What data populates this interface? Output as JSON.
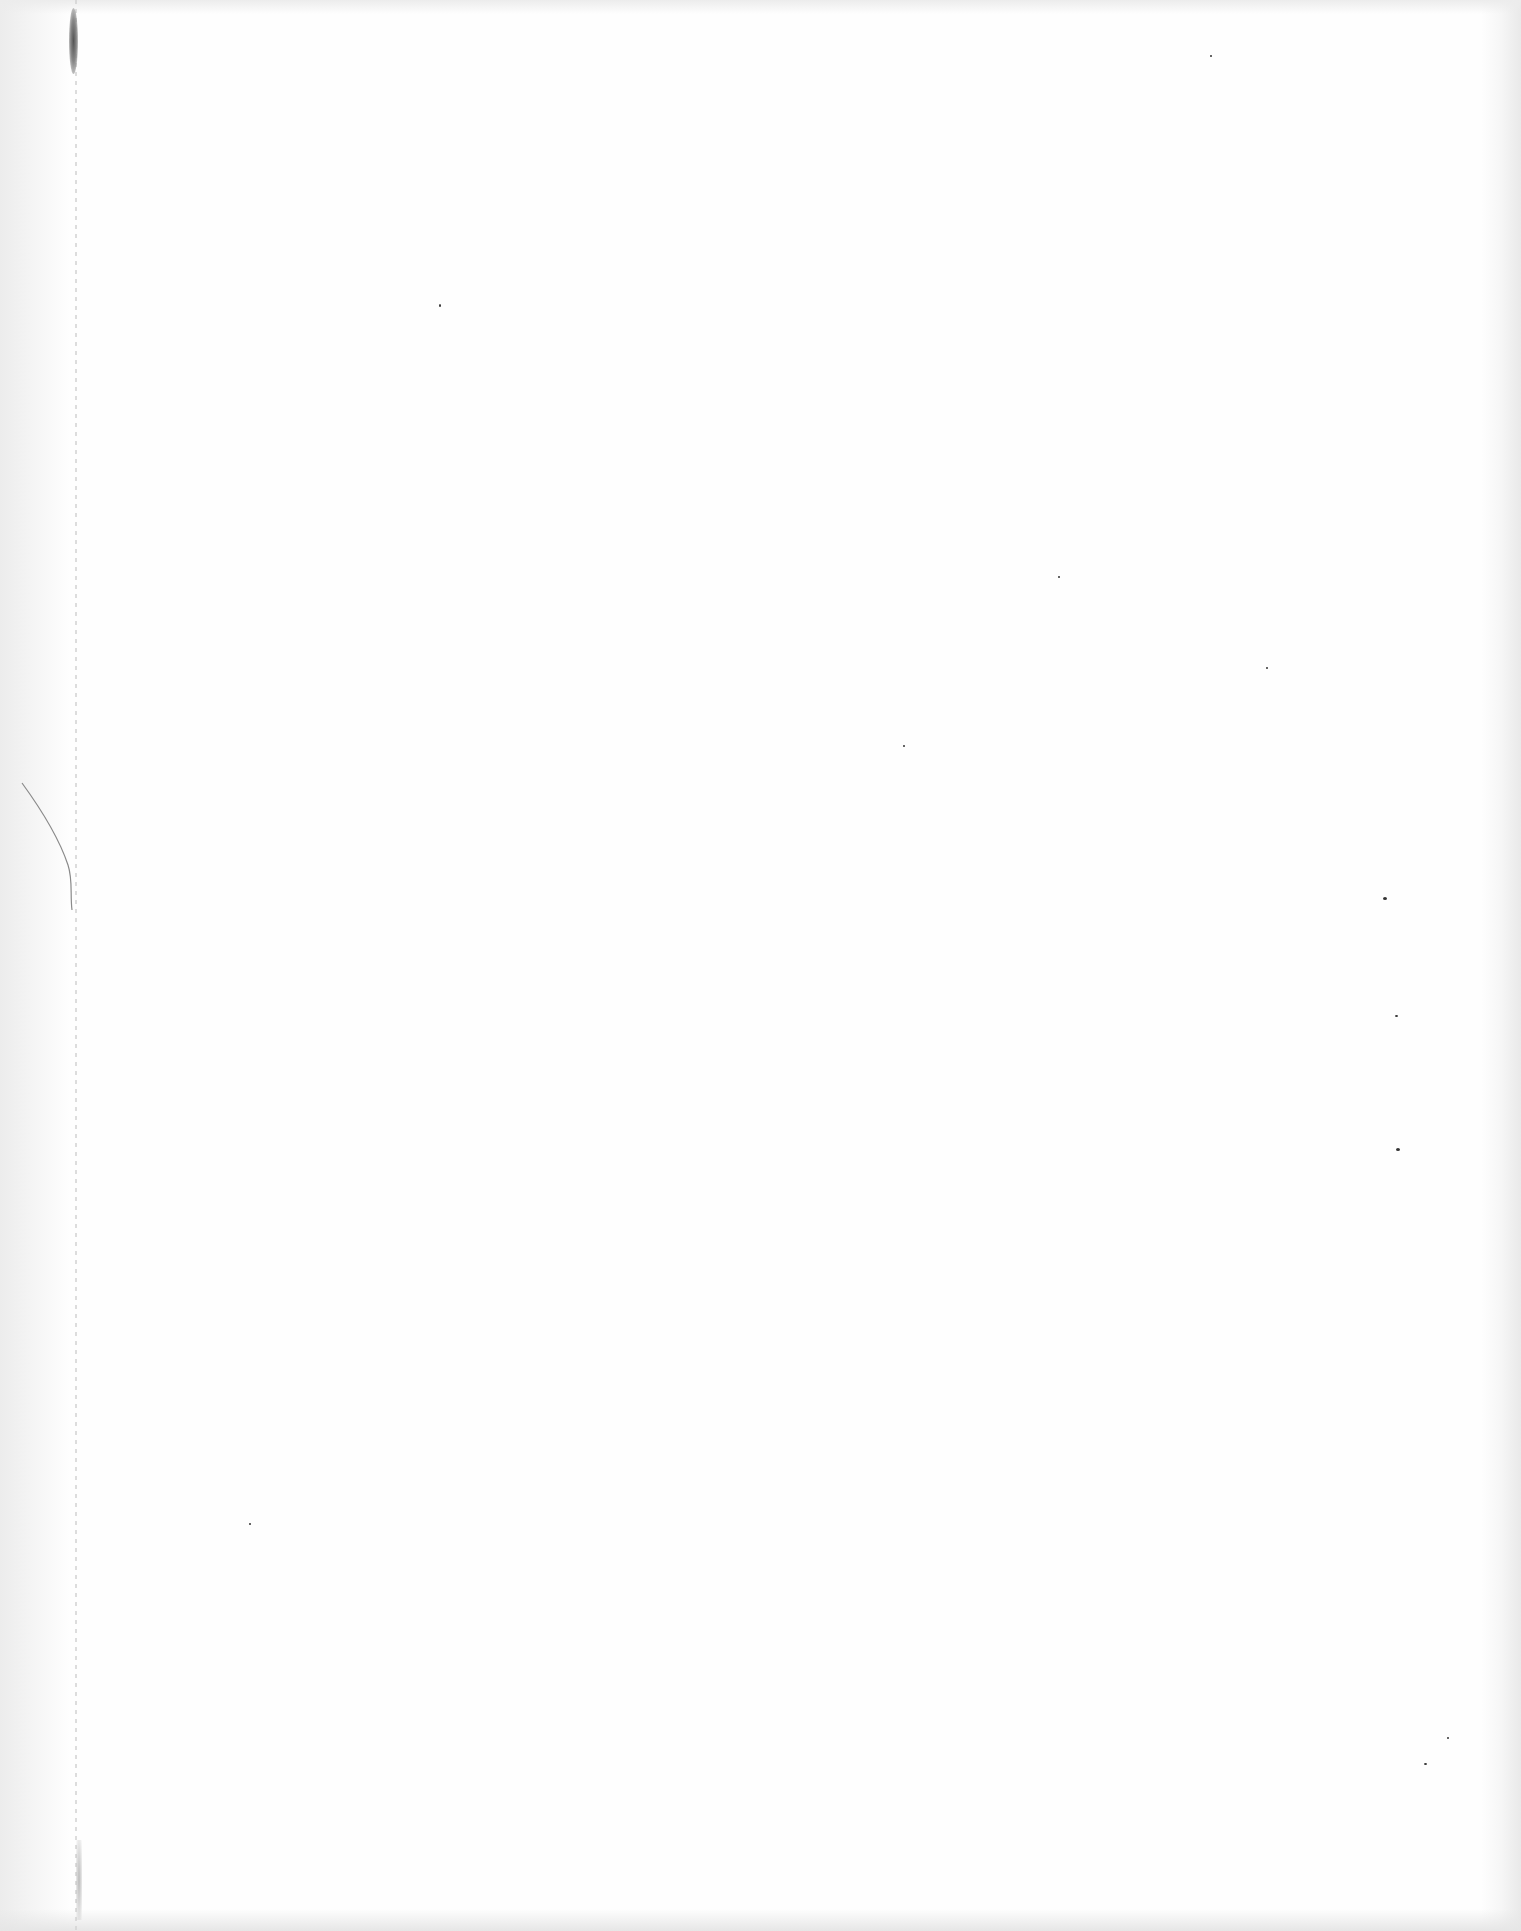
{
  "document": {
    "type": "blank scanned page",
    "text_content": "",
    "colors": {
      "paper": "#fefefe",
      "edge_shadow": "#e9e9e9",
      "binding_smudge": "#555555"
    },
    "artifacts": [
      {
        "kind": "binding-smudge",
        "x": 73,
        "y": 40
      },
      {
        "kind": "binding-line",
        "x": 75
      },
      {
        "kind": "hair-fiber",
        "x": 50,
        "y": 840
      },
      {
        "kind": "speck",
        "x": 440,
        "y": 305
      },
      {
        "kind": "speck",
        "x": 1058,
        "y": 577
      },
      {
        "kind": "speck",
        "x": 1266,
        "y": 668
      },
      {
        "kind": "speck",
        "x": 903,
        "y": 746
      },
      {
        "kind": "speck",
        "x": 1384,
        "y": 898
      },
      {
        "kind": "speck",
        "x": 1396,
        "y": 1016
      },
      {
        "kind": "speck",
        "x": 1397,
        "y": 1149
      },
      {
        "kind": "speck",
        "x": 249,
        "y": 1523
      },
      {
        "kind": "speck",
        "x": 1448,
        "y": 1738
      },
      {
        "kind": "speck",
        "x": 1425,
        "y": 1764
      },
      {
        "kind": "speck",
        "x": 1210,
        "y": 55
      }
    ]
  }
}
